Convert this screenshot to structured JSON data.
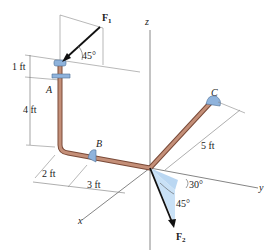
{
  "diagram": {
    "axes": {
      "x": "x",
      "y": "y",
      "z": "z"
    },
    "points": {
      "A": "A",
      "B": "B",
      "C": "C"
    },
    "forces": {
      "f1": "F",
      "f1_sub": "1",
      "f2": "F",
      "f2_sub": "2"
    },
    "angles": {
      "f1_angle": "45°",
      "f2_angle_a": "30°",
      "f2_angle_b": "45°"
    },
    "dimensions": {
      "d1": "1 ft",
      "d2": "4 ft",
      "d3": "2 ft",
      "d4": "3 ft",
      "d5": "5 ft"
    },
    "colors": {
      "pipe": "#b07a62",
      "support": "#8fb3dc",
      "shade": "#a9cdef",
      "line": "#555555"
    }
  }
}
